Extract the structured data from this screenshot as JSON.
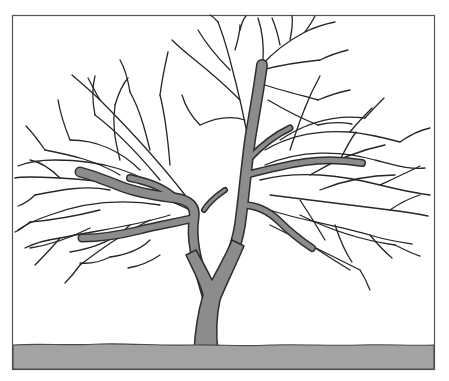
{
  "illustration": {
    "subject": "bare deciduous tree",
    "description": "Line drawing of a leafless tree with a forked gray trunk and a wide crown of dark twigs, standing on a gray ground strip inside a rectangular frame",
    "colors": {
      "background": "#ffffff",
      "frame": "#555555",
      "ground_fill": "#a3a3a3",
      "ground_outline": "#4a4a4a",
      "trunk_fill": "#8c8c8c",
      "trunk_outline": "#2e2e2e",
      "twig": "#262626"
    }
  }
}
